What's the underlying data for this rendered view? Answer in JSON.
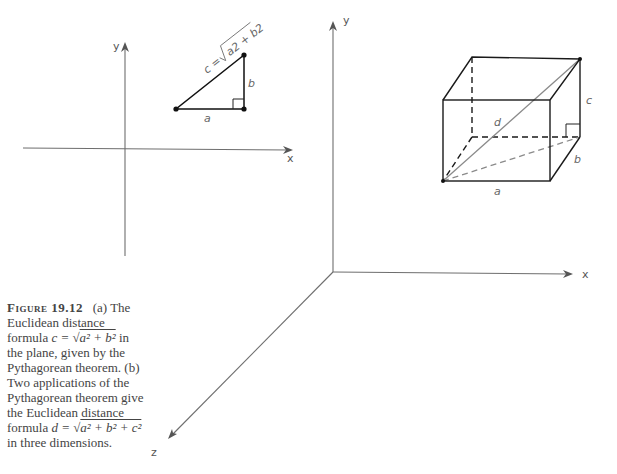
{
  "figure": {
    "panel_a": {
      "axis_labels": {
        "x": "x",
        "y": "y"
      },
      "side_labels": {
        "a": "a",
        "b": "b"
      },
      "hypotenuse_formula": {
        "lhs": "c =",
        "radicand": "a2 + b2"
      }
    },
    "panel_b": {
      "axis_labels": {
        "x": "x",
        "y": "y",
        "z": "z"
      },
      "edge_labels": {
        "a": "a",
        "b": "b",
        "c": "c",
        "d": "d"
      }
    }
  },
  "caption": {
    "figure_number": "Figure 19.12",
    "part_a_prefix": "(a) The Euclidean distance formula",
    "formula_c_lhs": "c =",
    "formula_c_radicand": "a² + b²",
    "part_a_suffix": "in the plane, given by the Pythagorean theorem.",
    "part_b_prefix": "(b) Two applications of the Pythagorean theorem give the Euclidean distance formula",
    "formula_d_lhs": "d =",
    "formula_d_radicand": "a² + b² + c²",
    "part_b_suffix": "in three dimensions."
  }
}
